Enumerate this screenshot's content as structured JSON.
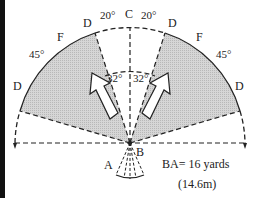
{
  "diagram": {
    "points": {
      "A": "A",
      "B": "B",
      "C": "C",
      "D": "D",
      "F": "F"
    },
    "angles": {
      "c_side": "20°",
      "inner": "32°",
      "outer": "45°"
    },
    "caption": {
      "line1": "BA= 16 yards",
      "line2": "(14.6m)"
    },
    "colors": {
      "shade": "#cfcfcf",
      "line": "#222222",
      "border": "#111111"
    }
  }
}
